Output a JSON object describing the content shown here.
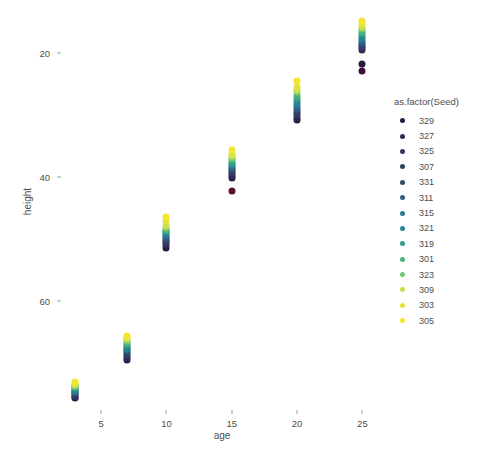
{
  "chart_data": {
    "type": "scatter",
    "title": "",
    "xlabel": "age",
    "ylabel": "height",
    "xlim": [
      2,
      26.5
    ],
    "ylim": [
      2.5,
      67
    ],
    "xticks": [
      5,
      10,
      15,
      20,
      25
    ],
    "yticks": [
      20,
      40,
      60
    ],
    "grid": false,
    "legend_position": "right",
    "legend_title": "as.factor(Seed)",
    "color_scale": "viridis",
    "series": [
      {
        "name": "329",
        "color": "#2b1a44",
        "points": [
          [
            3,
            4.4
          ],
          [
            7,
            10.6
          ],
          [
            10,
            28.6
          ],
          [
            15,
            39.9
          ],
          [
            20,
            49.2
          ],
          [
            25,
            58.3
          ]
        ]
      },
      {
        "name": "327",
        "color": "#2f2a55",
        "points": [
          [
            3,
            4.6
          ],
          [
            7,
            10.9
          ],
          [
            10,
            29.1
          ],
          [
            15,
            40.3
          ],
          [
            20,
            49.6
          ],
          [
            25,
            60.6
          ]
        ]
      },
      {
        "name": "325",
        "color": "#31355f",
        "points": [
          [
            3,
            4.8
          ],
          [
            7,
            11.2
          ],
          [
            10,
            29.5
          ],
          [
            15,
            40.6
          ],
          [
            20,
            50.0
          ],
          [
            25,
            60.9
          ]
        ]
      },
      {
        "name": "307",
        "color": "#323f64",
        "points": [
          [
            3,
            5.0
          ],
          [
            7,
            11.5
          ],
          [
            10,
            29.8
          ],
          [
            15,
            40.9
          ],
          [
            20,
            50.4
          ],
          [
            25,
            61.2
          ]
        ]
      },
      {
        "name": "331",
        "color": "#31496b",
        "points": [
          [
            3,
            5.2
          ],
          [
            7,
            11.8
          ],
          [
            10,
            30.1
          ],
          [
            15,
            41.2
          ],
          [
            20,
            50.8
          ],
          [
            25,
            61.5
          ]
        ]
      },
      {
        "name": "311",
        "color": "#2e5e8a",
        "points": [
          [
            3,
            5.4
          ],
          [
            7,
            12.1
          ],
          [
            10,
            30.4
          ],
          [
            15,
            41.5
          ],
          [
            20,
            51.2
          ],
          [
            25,
            61.9
          ]
        ]
      },
      {
        "name": "315",
        "color": "#2a788e",
        "points": [
          [
            3,
            5.6
          ],
          [
            7,
            12.4
          ],
          [
            10,
            30.7
          ],
          [
            15,
            41.8
          ],
          [
            20,
            51.7
          ],
          [
            25,
            62.3
          ]
        ]
      },
      {
        "name": "321",
        "color": "#26838e",
        "points": [
          [
            3,
            5.8
          ],
          [
            7,
            12.7
          ],
          [
            10,
            31.0
          ],
          [
            15,
            42.1
          ],
          [
            20,
            52.2
          ],
          [
            25,
            62.7
          ]
        ]
      },
      {
        "name": "319",
        "color": "#2f9e8b",
        "points": [
          [
            3,
            6.0
          ],
          [
            7,
            13.0
          ],
          [
            10,
            31.3
          ],
          [
            15,
            42.4
          ],
          [
            20,
            52.7
          ],
          [
            25,
            63.1
          ]
        ]
      },
      {
        "name": "301",
        "color": "#4ab07e",
        "points": [
          [
            3,
            6.2
          ],
          [
            7,
            13.3
          ],
          [
            10,
            31.6
          ],
          [
            15,
            42.8
          ],
          [
            20,
            53.2
          ],
          [
            25,
            63.5
          ]
        ]
      },
      {
        "name": "323",
        "color": "#77c96f",
        "points": [
          [
            3,
            6.4
          ],
          [
            7,
            13.6
          ],
          [
            10,
            31.9
          ],
          [
            15,
            43.1
          ],
          [
            20,
            53.7
          ],
          [
            25,
            63.9
          ]
        ]
      },
      {
        "name": "309",
        "color": "#c6df4d",
        "points": [
          [
            3,
            6.6
          ],
          [
            7,
            13.9
          ],
          [
            10,
            32.2
          ],
          [
            15,
            43.4
          ],
          [
            20,
            54.1
          ],
          [
            25,
            64.3
          ]
        ]
      },
      {
        "name": "303",
        "color": "#dfe53e",
        "points": [
          [
            3,
            6.8
          ],
          [
            7,
            14.2
          ],
          [
            10,
            32.9
          ],
          [
            15,
            43.8
          ],
          [
            20,
            54.6
          ],
          [
            25,
            64.7
          ]
        ]
      },
      {
        "name": "305",
        "color": "#f2e62e",
        "points": [
          [
            3,
            7.0
          ],
          [
            7,
            14.5
          ],
          [
            10,
            33.6
          ],
          [
            15,
            44.4
          ],
          [
            20,
            55.6
          ],
          [
            25,
            65.2
          ]
        ]
      }
    ],
    "extra_points": [
      {
        "x": 15,
        "y": 37.8,
        "color": "#5a1030"
      },
      {
        "x": 25,
        "y": 57.2,
        "color": "#3b0f3a"
      }
    ]
  },
  "axes": {
    "y_tick_labels": [
      "60",
      "40",
      "20"
    ],
    "x_tick_labels": [
      "5",
      "10",
      "15",
      "20",
      "25"
    ],
    "y_title": "height",
    "x_title": "age"
  },
  "legend": {
    "title": "as.factor(Seed)",
    "items": [
      {
        "label": "329",
        "color": "#2b1a44"
      },
      {
        "label": "327",
        "color": "#2f2a55"
      },
      {
        "label": "325",
        "color": "#31355f"
      },
      {
        "label": "307",
        "color": "#323f64"
      },
      {
        "label": "331",
        "color": "#31496b"
      },
      {
        "label": "311",
        "color": "#2e5e8a"
      },
      {
        "label": "315",
        "color": "#2a788e"
      },
      {
        "label": "321",
        "color": "#26838e"
      },
      {
        "label": "319",
        "color": "#2f9e8b"
      },
      {
        "label": "301",
        "color": "#4ab07e"
      },
      {
        "label": "323",
        "color": "#77c96f"
      },
      {
        "label": "309",
        "color": "#c6df4d"
      },
      {
        "label": "303",
        "color": "#dfe53e"
      },
      {
        "label": "305",
        "color": "#f2e62e"
      }
    ]
  }
}
